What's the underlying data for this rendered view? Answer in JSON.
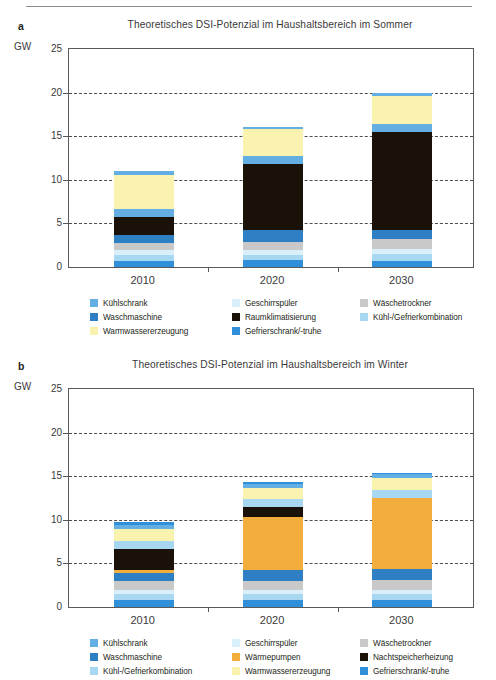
{
  "page": {
    "top_rule": true
  },
  "axis": {
    "unit": "GW",
    "yticks": [
      0,
      5,
      10,
      15,
      20,
      25
    ],
    "ytick_labels": [
      "0",
      "5",
      "10",
      "15",
      "20",
      "25"
    ],
    "ymin": 0,
    "ymax": 25,
    "xcategories": [
      "2010",
      "2020",
      "2030"
    ],
    "grid": "dashed horizontal at 5,10,15,20"
  },
  "panels": [
    {
      "letter": "a",
      "title": "Theoretisches DSI-Potenzial im Haushaltsbereich im Sommer"
    },
    {
      "letter": "b",
      "title": "Theoretisches DSI-Potenzial im Haushaltsbereich im Winter"
    }
  ],
  "colors": {
    "kuehlschrank": "#63aee3",
    "geschirrspueler": "#d9f0fb",
    "waeschetrockner": "#c9c9c9",
    "waschmaschine": "#2f7fc4",
    "raumklimatisierung": "#1a1209",
    "nachtspeicherheizung": "#1a1209",
    "waermepumpen": "#f2ad3c",
    "kuehl_gefrierkombination": "#a8d7f2",
    "warmwassererzeugung": "#faf3b0",
    "gefrierschrank_truhe": "#2f8fd8"
  },
  "legend_a": {
    "rows": [
      [
        {
          "label": "Kühlschrank",
          "color": "#63aee3",
          "key": "kuehlschrank"
        },
        {
          "label": "Geschirrspüler",
          "color": "#d9f0fb",
          "key": "geschirrspueler"
        },
        {
          "label": "Wäschetrockner",
          "color": "#c9c9c9",
          "key": "waeschetrockner"
        }
      ],
      [
        {
          "label": "Waschmaschine",
          "color": "#2f7fc4",
          "key": "waschmaschine"
        },
        {
          "label": "Raumklimatisierung",
          "color": "#1a1209",
          "key": "raumklimatisierung"
        },
        {
          "label": "Kühl-/Gefrierkombination",
          "color": "#a8d7f2",
          "key": "kuehl_gefrierkombination"
        }
      ],
      [
        {
          "label": "Warmwassererzeugung",
          "color": "#faf3b0",
          "key": "warmwassererzeugung"
        },
        {
          "label": "Gefrierschrank/-truhe",
          "color": "#2f8fd8",
          "key": "gefrierschrank_truhe"
        },
        {
          "label": "",
          "color": "",
          "key": ""
        }
      ]
    ]
  },
  "legend_b": {
    "rows": [
      [
        {
          "label": "Kühlschrank",
          "color": "#63aee3",
          "key": "kuehlschrank"
        },
        {
          "label": "Geschirrspüler",
          "color": "#d9f0fb",
          "key": "geschirrspueler"
        },
        {
          "label": "Wäschetrockner",
          "color": "#c9c9c9",
          "key": "waeschetrockner"
        }
      ],
      [
        {
          "label": "Waschmaschine",
          "color": "#2f7fc4",
          "key": "waschmaschine"
        },
        {
          "label": "Wärmepumpen",
          "color": "#f2ad3c",
          "key": "waermepumpen"
        },
        {
          "label": "Nachtspeicherheizung",
          "color": "#1a1209",
          "key": "nachtspeicherheizung"
        }
      ],
      [
        {
          "label": "Kühl-/Gefrierkombination",
          "color": "#a8d7f2",
          "key": "kuehl_gefrierkombination"
        },
        {
          "label": "Warmwassererzeugung",
          "color": "#faf3b0",
          "key": "warmwassererzeugung"
        },
        {
          "label": "Gefrierschrank/-truhe",
          "color": "#2f8fd8",
          "key": "gefrierschrank_truhe"
        }
      ]
    ]
  },
  "chart_data": [
    {
      "type": "bar",
      "subtype": "stacked",
      "panel": "a",
      "title": "Theoretisches DSI-Potenzial im Haushaltsbereich im Sommer",
      "xlabel": "",
      "ylabel": "GW",
      "ylim": [
        0,
        25
      ],
      "yticks": [
        0,
        5,
        10,
        15,
        20,
        25
      ],
      "grid": true,
      "legend_position": "below",
      "categories": [
        "2010",
        "2020",
        "2030"
      ],
      "series": [
        {
          "name": "Gefrierschrank/-truhe",
          "color": "#2f8fd8",
          "values": [
            0.7,
            0.8,
            0.7
          ]
        },
        {
          "name": "Kühl-/Gefrierkombination",
          "color": "#a8d7f2",
          "values": [
            0.7,
            0.6,
            0.8
          ]
        },
        {
          "name": "Geschirrspüler",
          "color": "#d9f0fb",
          "values": [
            0.5,
            0.5,
            0.6
          ]
        },
        {
          "name": "Wäschetrockner",
          "color": "#c9c9c9",
          "values": [
            0.9,
            1.0,
            1.1
          ]
        },
        {
          "name": "Waschmaschine",
          "color": "#2f7fc4",
          "values": [
            0.9,
            1.3,
            1.0
          ]
        },
        {
          "name": "Raumklimatisierung",
          "color": "#1a1209",
          "values": [
            2.0,
            7.6,
            11.3
          ]
        },
        {
          "name": "Kühlschrank",
          "color": "#63aee3",
          "values": [
            0.9,
            0.9,
            0.9
          ]
        },
        {
          "name": "Warmwassererzeugung",
          "color": "#faf3b0",
          "values": [
            4.0,
            3.1,
            3.2
          ]
        },
        {
          "name": "Kühlschrank (oberste Lage)",
          "color": "#63aee3",
          "values": [
            0.4,
            0.3,
            0.3
          ]
        }
      ],
      "totals": [
        11.0,
        16.1,
        19.9
      ]
    },
    {
      "type": "bar",
      "subtype": "stacked",
      "panel": "b",
      "title": "Theoretisches DSI-Potenzial im Haushaltsbereich im Winter",
      "xlabel": "",
      "ylabel": "GW",
      "ylim": [
        0,
        25
      ],
      "yticks": [
        0,
        5,
        10,
        15,
        20,
        25
      ],
      "grid": true,
      "legend_position": "below",
      "categories": [
        "2010",
        "2020",
        "2030"
      ],
      "series": [
        {
          "name": "Gefrierschrank/-truhe",
          "color": "#2f8fd8",
          "values": [
            0.8,
            0.8,
            0.8
          ]
        },
        {
          "name": "Kühl-/Gefrierkombination",
          "color": "#a8d7f2",
          "values": [
            0.7,
            0.7,
            0.7
          ]
        },
        {
          "name": "Geschirrspüler",
          "color": "#d9f0fb",
          "values": [
            0.5,
            0.5,
            0.5
          ]
        },
        {
          "name": "Wäschetrockner",
          "color": "#c9c9c9",
          "values": [
            1.0,
            1.0,
            1.1
          ]
        },
        {
          "name": "Waschmaschine",
          "color": "#2f7fc4",
          "values": [
            0.9,
            1.2,
            1.3
          ]
        },
        {
          "name": "Wärmepumpen",
          "color": "#f2ad3c",
          "values": [
            0.3,
            6.1,
            8.1
          ]
        },
        {
          "name": "Nachtspeicherheizung",
          "color": "#1a1209",
          "values": [
            2.5,
            1.2,
            0.0
          ]
        },
        {
          "name": "Kühl-/Gefrierkombination (oben)",
          "color": "#a8d7f2",
          "values": [
            0.9,
            0.9,
            0.9
          ]
        },
        {
          "name": "Warmwassererzeugung",
          "color": "#faf3b0",
          "values": [
            1.3,
            1.3,
            1.4
          ]
        },
        {
          "name": "Kühlschrank",
          "color": "#63aee3",
          "values": [
            0.5,
            0.4,
            0.4
          ]
        },
        {
          "name": "Gefrierschrank/-truhe (oben)",
          "color": "#2f8fd8",
          "values": [
            0.3,
            0.2,
            0.2
          ]
        }
      ],
      "totals": [
        10.4,
        14.4,
        15.4
      ]
    }
  ]
}
